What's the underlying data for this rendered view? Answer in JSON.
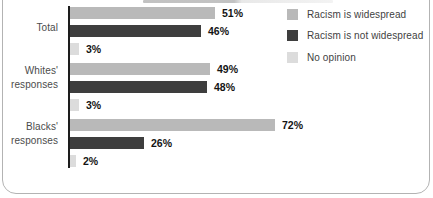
{
  "card": {
    "background": "#ffffff",
    "border_color": "#b3b3b3"
  },
  "chart_data": {
    "type": "bar",
    "orientation": "horizontal",
    "categories": [
      "Total",
      "Whites' responses",
      "Blacks' responses"
    ],
    "series": [
      {
        "name": "Racism is widespread",
        "color": "#b9b9b9",
        "values": [
          51,
          49,
          72
        ]
      },
      {
        "name": "Racism is not widespread",
        "color": "#3e3e3e",
        "values": [
          46,
          48,
          26
        ]
      },
      {
        "name": "No opinion",
        "color": "#dcdcdc",
        "values": [
          3,
          3,
          2
        ]
      }
    ],
    "value_labels": {
      "Total": [
        "51%",
        "46%",
        "3%"
      ],
      "Whites' responses": [
        "49%",
        "48%",
        "3%"
      ],
      "Blacks' responses": [
        "72%",
        "26%",
        "2%"
      ]
    },
    "value_suffix": "%",
    "xlim": [
      0,
      100
    ],
    "grid": false,
    "axis_color": "#1d1d1d",
    "legend_position": "top-right",
    "legend": [
      "Racism is widespread",
      "Racism is not widespread",
      "No opinion"
    ]
  }
}
